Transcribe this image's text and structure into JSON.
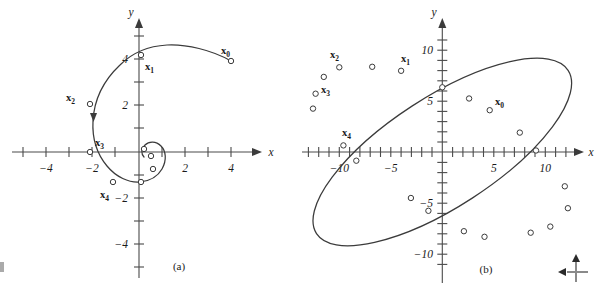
{
  "figure": {
    "type": "two-panel-phase-portrait",
    "background_color": "#ffffff",
    "curve_color": "#3b3b3b",
    "axis_color": "#4a4a4a",
    "panels": [
      {
        "id": "a",
        "caption": "(a)",
        "xlabel": "x",
        "ylabel": "y",
        "xlim": [
          -5.4,
          5.6
        ],
        "ylim": [
          -5.4,
          5.2
        ],
        "x_ticks": [
          -5,
          -4,
          -3,
          -2,
          -1,
          1,
          2,
          3,
          4,
          5
        ],
        "y_ticks": [
          -5,
          -4,
          -3,
          -2,
          -1,
          1,
          2,
          3,
          4,
          5
        ],
        "x_tick_labels": [
          {
            "value": -4,
            "text": "−4"
          },
          {
            "value": -2,
            "text": "−2"
          },
          {
            "value": 2,
            "text": "2"
          },
          {
            "value": 4,
            "text": "4"
          }
        ],
        "y_tick_labels": [
          {
            "value": 4,
            "text": "4"
          },
          {
            "value": 2,
            "text": "2"
          },
          {
            "value": -2,
            "text": "−2"
          },
          {
            "value": -4,
            "text": "−4"
          }
        ],
        "description": "Inward spiral trajectory converging to the origin (attractor)",
        "points": [
          {
            "label": "x",
            "sub": "0",
            "x": 4.0,
            "y": 3.95,
            "label_dx": -2,
            "label_dy": -9,
            "show_label": true
          },
          {
            "label": "x",
            "sub": "1",
            "x": 0.1,
            "y": 4.2,
            "label_dx": 6,
            "label_dy": 12,
            "show_label": true
          },
          {
            "label": "x",
            "sub": "2",
            "x": -2.12,
            "y": 2.1,
            "label_dx": -24,
            "label_dy": -4,
            "show_label": true
          },
          {
            "label": "x",
            "sub": "3",
            "x": -2.12,
            "y": -0.02,
            "label_dx": 4,
            "label_dy": -7,
            "show_label": true
          },
          {
            "label": "x",
            "sub": "4",
            "x": -1.12,
            "y": -1.32,
            "label_dx": -8,
            "label_dy": 15,
            "show_label": true
          },
          {
            "label": "x",
            "sub": "5",
            "x": 0.08,
            "y": -1.3,
            "label_dx": 0,
            "label_dy": 0,
            "show_label": false
          },
          {
            "label": "x",
            "sub": "6",
            "x": 0.6,
            "y": -0.75,
            "label_dx": 0,
            "label_dy": 0,
            "show_label": false
          },
          {
            "label": "x",
            "sub": "7",
            "x": 0.52,
            "y": -0.18,
            "label_dx": 0,
            "label_dy": 0,
            "show_label": false
          },
          {
            "label": "x",
            "sub": "8",
            "x": 0.2,
            "y": 0.12,
            "label_dx": 0,
            "label_dy": 0,
            "show_label": false
          }
        ],
        "has_direction_arrow": true
      },
      {
        "id": "b",
        "caption": "(b)",
        "xlabel": "x",
        "ylabel": "y",
        "xlim": [
          -13.5,
          13.5
        ],
        "ylim": [
          -12.5,
          12.0
        ],
        "x_ticks": [
          -13,
          -12,
          -11,
          -10,
          -9,
          -8,
          -7,
          -6,
          -5,
          -4,
          -3,
          -2,
          -1,
          1,
          2,
          3,
          4,
          5,
          6,
          7,
          8,
          9,
          10,
          11,
          12,
          13
        ],
        "y_ticks": [
          -11,
          -10,
          -9,
          -8,
          -7,
          -6,
          -5,
          -4,
          -3,
          -2,
          -1,
          1,
          2,
          3,
          4,
          5,
          6,
          7,
          8,
          9,
          10,
          11
        ],
        "x_tick_labels": [
          {
            "value": -10,
            "text": "−10"
          },
          {
            "value": -5,
            "text": "−5"
          },
          {
            "value": 5,
            "text": "5"
          },
          {
            "value": 10,
            "text": "10"
          }
        ],
        "y_tick_labels": [
          {
            "value": 10,
            "text": "10"
          },
          {
            "value": 5,
            "text": "5"
          },
          {
            "value": -5,
            "text": "−5"
          },
          {
            "value": -10,
            "text": "−10"
          }
        ],
        "description": "Closed elliptical orbit tilted from upper-left to lower-right (center / periodic solution)",
        "ellipse": {
          "center": [
            0.0,
            0.0
          ],
          "semi_major": 14.6,
          "semi_minor": 5.35,
          "rotation_deg": -33.0
        },
        "points": [
          {
            "label": "x",
            "sub": "0",
            "x": 4.6,
            "y": 4.1,
            "label_dx": 6,
            "label_dy": -5,
            "show_label": true
          },
          {
            "label": "x",
            "sub": "1",
            "x": -4.0,
            "y": 7.95,
            "label_dx": 2,
            "label_dy": -8,
            "show_label": true
          },
          {
            "label": "x",
            "sub": "2",
            "x": -10.0,
            "y": 8.3,
            "label_dx": -6,
            "label_dy": -8,
            "show_label": true
          },
          {
            "label": "x",
            "sub": "3",
            "x": -12.3,
            "y": 5.7,
            "label_dx": 6,
            "label_dy": 0,
            "show_label": true
          },
          {
            "label": "x",
            "sub": "4",
            "x": -9.6,
            "y": 0.65,
            "label_dx": 2,
            "label_dy": -8,
            "show_label": true
          },
          {
            "label": "x",
            "sub": "5",
            "x": 2.6,
            "y": 5.25,
            "label_dx": 0,
            "label_dy": 0,
            "show_label": false
          },
          {
            "label": "x",
            "sub": "6",
            "x": 0.0,
            "y": 6.35,
            "label_dx": 0,
            "label_dy": 0,
            "show_label": false
          },
          {
            "label": "x",
            "sub": "7",
            "x": -6.8,
            "y": 8.35,
            "label_dx": 0,
            "label_dy": 0,
            "show_label": false
          },
          {
            "label": "x",
            "sub": "8",
            "x": -11.5,
            "y": 7.35,
            "label_dx": 0,
            "label_dy": 0,
            "show_label": false
          },
          {
            "label": "x",
            "sub": "9",
            "x": -12.55,
            "y": 4.25,
            "label_dx": 0,
            "label_dy": 0,
            "show_label": false
          },
          {
            "label": "x",
            "sub": "10",
            "x": -8.35,
            "y": -0.85,
            "label_dx": 0,
            "label_dy": 0,
            "show_label": false
          },
          {
            "label": "x",
            "sub": "11",
            "x": -3.05,
            "y": -4.5,
            "label_dx": 0,
            "label_dy": 0,
            "show_label": false
          },
          {
            "label": "x",
            "sub": "12",
            "x": -1.35,
            "y": -5.75,
            "label_dx": 0,
            "label_dy": 0,
            "show_label": false
          },
          {
            "label": "x",
            "sub": "13",
            "x": 2.1,
            "y": -7.75,
            "label_dx": 0,
            "label_dy": 0,
            "show_label": false
          },
          {
            "label": "x",
            "sub": "14",
            "x": 4.1,
            "y": -8.3,
            "label_dx": 0,
            "label_dy": 0,
            "show_label": false
          },
          {
            "label": "x",
            "sub": "15",
            "x": 8.6,
            "y": -7.9,
            "label_dx": 0,
            "label_dy": 0,
            "show_label": false
          },
          {
            "label": "x",
            "sub": "16",
            "x": 10.5,
            "y": -7.3,
            "label_dx": 0,
            "label_dy": 0,
            "show_label": false
          },
          {
            "label": "x",
            "sub": "17",
            "x": 12.2,
            "y": -5.5,
            "label_dx": 0,
            "label_dy": 0,
            "show_label": false
          },
          {
            "label": "x",
            "sub": "18",
            "x": 11.9,
            "y": -3.35,
            "label_dx": 0,
            "label_dy": 0,
            "show_label": false
          },
          {
            "label": "x",
            "sub": "19",
            "x": 9.1,
            "y": 0.15,
            "label_dx": 0,
            "label_dy": 0,
            "show_label": false
          },
          {
            "label": "x",
            "sub": "20",
            "x": 7.5,
            "y": 1.9,
            "label_dx": 0,
            "label_dy": 0,
            "show_label": false
          }
        ],
        "has_direction_arrow": false
      }
    ]
  },
  "cursor_icon": {
    "name": "move-axes-cursor",
    "up_arrow": "↑",
    "left_arrow": "←"
  }
}
